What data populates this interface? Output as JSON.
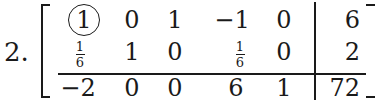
{
  "problem": {
    "label": "2."
  },
  "matrix": {
    "rows": [
      {
        "cells": [
          {
            "value": "1",
            "circled": true
          },
          {
            "value": "0"
          },
          {
            "value": "1"
          },
          {
            "value": "−1"
          },
          {
            "value": "0"
          }
        ],
        "rhs": "6"
      },
      {
        "cells": [
          {
            "value": "1/6",
            "fraction": {
              "num": "1",
              "den": "6"
            }
          },
          {
            "value": "1"
          },
          {
            "value": "0"
          },
          {
            "value": "1/6",
            "fraction": {
              "num": "1",
              "den": "6"
            }
          },
          {
            "value": "0"
          }
        ],
        "rhs": "2"
      },
      {
        "cells": [
          {
            "value": "−2"
          },
          {
            "value": "0"
          },
          {
            "value": "0"
          },
          {
            "value": "6"
          },
          {
            "value": "1"
          }
        ],
        "rhs": "72"
      }
    ],
    "pivot": {
      "row": 0,
      "col": 0,
      "value": "1"
    }
  }
}
